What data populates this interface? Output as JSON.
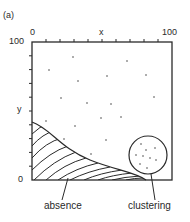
{
  "panel": {
    "label": "(a)"
  },
  "axes": {
    "x": {
      "name": "x",
      "min_label": "0",
      "max_label": "100",
      "ticks": 10
    },
    "y": {
      "name": "y",
      "min_label": "0",
      "max_label": "100",
      "ticks": 10
    }
  },
  "regions": {
    "absence": {
      "label": "absence",
      "fill": "hatched"
    },
    "clustering": {
      "label": "clustering",
      "shape": "circle"
    }
  },
  "colors": {
    "line": "#2a2a2a",
    "background": "#ffffff"
  }
}
